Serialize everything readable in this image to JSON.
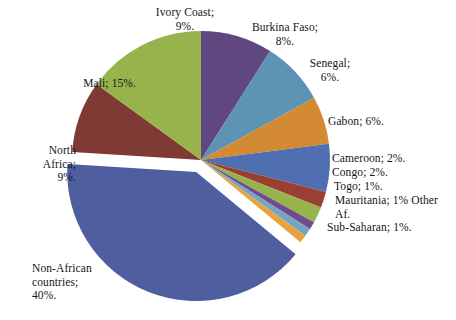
{
  "chart_data": {
    "type": "pie",
    "title": "",
    "subtitle": "",
    "legend_position": "none",
    "labels_inline": true,
    "units": "percent",
    "total": 100,
    "explode": [
      "Non-African countries"
    ],
    "categories": [
      "Ivory Coast",
      "Burkina Faso",
      "Senegal",
      "Gabon",
      "Cameroon",
      "Congo",
      "Togo",
      "Mauritania",
      "Other Sub-Saharan Af.",
      "Non-African countries",
      "North Africa",
      "Mali"
    ],
    "values": [
      9,
      8,
      6,
      6,
      2,
      2,
      1,
      1,
      1,
      40,
      9,
      15
    ],
    "colors": [
      "#61477F",
      "#5D93B5",
      "#D38A33",
      "#4F6FB0",
      "#9B3F32",
      "#96B44B",
      "#6D4D8C",
      "#72A6C4",
      "#E8A33D",
      "#4F5E9E",
      "#7F3A34",
      "#97B martin"
    ],
    "slices": [
      {
        "name": "Ivory Coast",
        "value": 9,
        "color": "#61477F",
        "label": "Ivory Coast;\n9%."
      },
      {
        "name": "Burkina Faso",
        "value": 8,
        "color": "#5D93B5",
        "label": "Burkina Faso;\n8%."
      },
      {
        "name": "Senegal",
        "value": 6,
        "color": "#D38A33",
        "label": "Senegal;\n6%."
      },
      {
        "name": "Gabon",
        "value": 6,
        "color": "#4F6FB0",
        "label": "Gabon; 6%."
      },
      {
        "name": "Cameroon",
        "value": 2,
        "color": "#9B3F32",
        "label": "Cameroon; 2%."
      },
      {
        "name": "Congo",
        "value": 2,
        "color": "#96B44B",
        "label": "Congo; 2%."
      },
      {
        "name": "Togo",
        "value": 1,
        "color": "#6D4D8C",
        "label": "Togo; 1%."
      },
      {
        "name": "Mauritania",
        "value": 1,
        "color": "#72A6C4",
        "label": "Mauritania; 1% Other Af."
      },
      {
        "name": "Other Sub-Saharan Af.",
        "value": 1,
        "color": "#E8A33D",
        "label": "Sub-Saharan; 1%."
      },
      {
        "name": "Non-African countries",
        "value": 40,
        "color": "#4F5E9E",
        "label": "Non-African\ncountries;\n40%."
      },
      {
        "name": "North Africa",
        "value": 9,
        "color": "#7F3A34",
        "label": "North\nAfrica;\n9%."
      },
      {
        "name": "Mali",
        "value": 15,
        "color": "#96B44B",
        "label": "Mali; 15%."
      }
    ]
  },
  "labels": {
    "ivory_coast": "Ivory Coast;\n9%.",
    "burkina_faso": "Burkina Faso;\n8%.",
    "senegal": "Senegal;\n6%.",
    "gabon": "Gabon; 6%.",
    "cameroon": "Cameroon; 2%.",
    "congo": "Congo; 2%.",
    "togo": "Togo; 1%.",
    "mauritania": "Mauritania; 1% Other\nAf.",
    "other_sub_saharan": "Sub-Saharan; 1%.",
    "mali": "Mali; 15%.",
    "north_africa": "North\nAfrica;\n9%.",
    "non_african": "Non-African\ncountries;\n40%."
  },
  "geometry": {
    "cx": 201,
    "cy": 160,
    "r": 129,
    "explode_offset": 13,
    "start_angle_deg": -90
  }
}
